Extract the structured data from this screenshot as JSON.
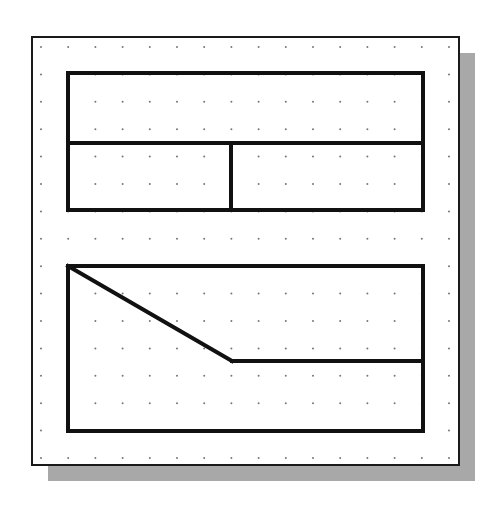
{
  "drawing": {
    "colors": {
      "background": "#ffffff",
      "paper": "#ffffff",
      "frame": "#1a1a1a",
      "shadow": "#a8a8a8",
      "line": "#111111",
      "grid_dot": "#777777"
    },
    "frame": {
      "x": 32,
      "y": 37,
      "width": 427,
      "height": 428,
      "stroke_width": 2
    },
    "shadow": {
      "offset_x": 16,
      "offset_y": 16
    },
    "grid": {
      "x_start": 41,
      "y_start": 47,
      "spacing_x": 27.2,
      "spacing_y": 27.4,
      "cols": 16,
      "rows": 16,
      "dot_radius": 1
    },
    "upper_rect": {
      "x": 68,
      "y": 73,
      "width": 355,
      "height": 137
    },
    "upper_hdivider": {
      "x1": 68,
      "y1": 143,
      "x2": 423,
      "y2": 143
    },
    "upper_vdivider": {
      "x1": 231,
      "y1": 143,
      "x2": 231,
      "y2": 210
    },
    "lower_rect": {
      "x": 68,
      "y": 266,
      "width": 355,
      "height": 165
    },
    "lower_diagonal": {
      "x1": 68,
      "y1": 266,
      "x2": 232,
      "y2": 361
    },
    "lower_hline": {
      "x1": 232,
      "y1": 361,
      "x2": 423,
      "y2": 361
    },
    "stroke_width": 4
  }
}
